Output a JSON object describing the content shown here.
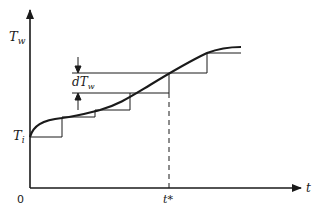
{
  "diagram": {
    "type": "staircase-approximation-of-curve",
    "axes": {
      "y_label": "T",
      "y_label_sub": "w",
      "x_label": "t",
      "origin_label": "0"
    },
    "annotations": {
      "initial_label": "T",
      "initial_label_sub": "i",
      "increment_label_prefix": "dT",
      "increment_label_sub": "w",
      "time_marker_label": "t*"
    },
    "curve_points": [
      [
        30,
        137
      ],
      [
        45,
        122
      ],
      [
        62,
        118
      ],
      [
        95,
        111
      ],
      [
        130,
        95
      ],
      [
        169,
        74
      ],
      [
        207,
        53
      ],
      [
        225,
        48
      ],
      [
        241,
        47
      ]
    ],
    "steps": [
      {
        "x0": 30,
        "x1": 62,
        "y": 137,
        "y_next": 117
      },
      {
        "x0": 62,
        "x1": 95,
        "y": 117,
        "y_next": 110
      },
      {
        "x0": 95,
        "x1": 130,
        "y": 110,
        "y_next": 93
      },
      {
        "x0": 130,
        "x1": 169,
        "y": 93,
        "y_next": 73
      },
      {
        "x0": 169,
        "x1": 207,
        "y": 73,
        "y_next": 53
      },
      {
        "x0": 207,
        "x1": 241,
        "y": 53,
        "y_next": null
      }
    ],
    "colors": {
      "line": "#1a1a1a",
      "background": "#ffffff"
    }
  }
}
